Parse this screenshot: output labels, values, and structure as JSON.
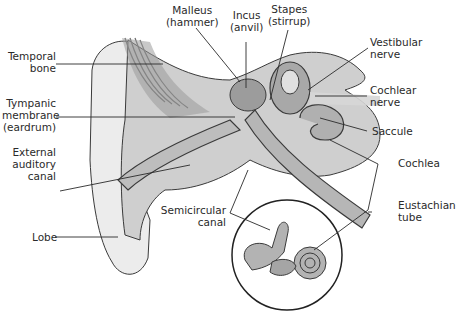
{
  "diagram": {
    "inset": "Inner ear: semicircular canals and cochlea",
    "colors": {
      "background": "#ffffff",
      "outline": "#3a3a3a",
      "skin": "#ececec",
      "bone": "#cfcfcf",
      "soft_tissue": "#a8a8a8",
      "label_text": "#2a2a2a"
    }
  },
  "labels": {
    "malleus": {
      "line1": "Malleus",
      "line2": "(hammer)"
    },
    "incus": {
      "line1": "Incus",
      "line2": "(anvil)"
    },
    "stapes": {
      "line1": "Stapes",
      "line2": "(stirrup)"
    },
    "vestibular_nerve": {
      "line1": "Vestibular",
      "line2": "nerve"
    },
    "temporal_bone": {
      "line1": "Temporal",
      "line2": "bone"
    },
    "cochlear_nerve": {
      "line1": "Cochlear",
      "line2": "nerve"
    },
    "tympanic_membrane": {
      "line1": "Tympanic",
      "line2": "membrane",
      "line3": "(eardrum)"
    },
    "saccule": {
      "line1": "Saccule"
    },
    "external_auditory_canal": {
      "line1": "External",
      "line2": "auditory",
      "line3": "canal"
    },
    "cochlea": {
      "line1": "Cochlea"
    },
    "eustachian_tube": {
      "line1": "Eustachian",
      "line2": "tube"
    },
    "semicircular_canal": {
      "line1": "Semicircular",
      "line2": "canal"
    },
    "lobe": {
      "line1": "Lobe"
    }
  }
}
